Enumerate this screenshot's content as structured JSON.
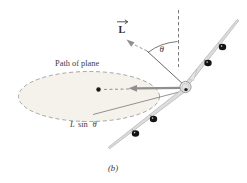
{
  "figure": {
    "caption": "(b)",
    "path_label": "Path of plane",
    "angular_momentum_label": "L",
    "theta_label": "θ",
    "component_label": {
      "l": "L",
      "sin": "sin",
      "theta": "θ"
    }
  },
  "colors": {
    "ink": "#3d3d3d",
    "arrow_gray": "#8f8f8f",
    "dash_gray": "#666666",
    "wing_fill": "#dcdcdc",
    "wing_stroke": "#999999",
    "fuselage_fill": "#e3e3e3",
    "fin_fill": "#e6e6e6",
    "engine": "#141414",
    "dot": "#1a1a1a",
    "ellipse_fill": "#f5f2ec",
    "background": "#ffffff"
  }
}
